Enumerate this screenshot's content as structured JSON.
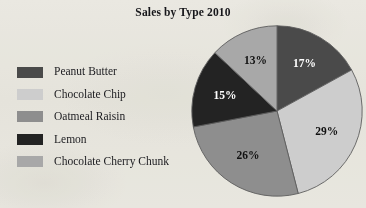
{
  "chart_data": {
    "type": "pie",
    "title": "Sales by Type 2010",
    "categories": [
      "Peanut Butter",
      "Chocolate Chip",
      "Oatmeal Raisin",
      "Lemon",
      "Chocolate Cherry Chunk"
    ],
    "values": [
      17,
      29,
      26,
      15,
      13
    ],
    "value_labels": [
      "17%",
      "29%",
      "26%",
      "15%",
      "13%"
    ],
    "units": "percent",
    "start_angle_deg": 0,
    "direction": "clockwise",
    "legend_position": "left",
    "grid": false,
    "xlabel": "",
    "ylabel": "",
    "colors": [
      "#4a4a4a",
      "#cdcdcd",
      "#8e8e8e",
      "#232323",
      "#a8a8a8"
    ],
    "label_colors": [
      "#ffffff",
      "#101010",
      "#111111",
      "#ffffff",
      "#111111"
    ],
    "slices": [
      {
        "label": "Peanut Butter",
        "value": 17,
        "value_label": "17%",
        "color": "#4a4a4a",
        "label_color": "#ffffff"
      },
      {
        "label": "Chocolate Chip",
        "value": 29,
        "value_label": "29%",
        "color": "#cdcdcd",
        "label_color": "#101010"
      },
      {
        "label": "Oatmeal Raisin",
        "value": 26,
        "value_label": "26%",
        "color": "#8e8e8e",
        "label_color": "#111111"
      },
      {
        "label": "Lemon",
        "value": 15,
        "value_label": "15%",
        "color": "#232323",
        "label_color": "#ffffff"
      },
      {
        "label": "Chocolate Cherry Chunk",
        "value": 13,
        "value_label": "13%",
        "color": "#a8a8a8",
        "label_color": "#111111"
      }
    ]
  },
  "figure": {
    "title": "Sales by Type 2010",
    "background_color": "#f2f1ec",
    "outline_color": "#5d5d5d"
  },
  "legend": {
    "items": [
      {
        "label": "Peanut Butter",
        "color": "#4a4a4a"
      },
      {
        "label": "Chocolate Chip",
        "color": "#cdcdcd"
      },
      {
        "label": "Oatmeal Raisin",
        "color": "#8e8e8e"
      },
      {
        "label": "Lemon",
        "color": "#232323"
      },
      {
        "label": "Chocolate Cherry Chunk",
        "color": "#a8a8a8"
      }
    ]
  }
}
